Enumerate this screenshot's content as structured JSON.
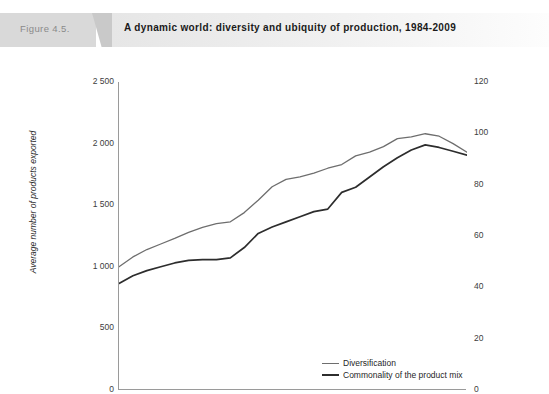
{
  "figure": {
    "number": "Figure 4.5.",
    "title": "A dynamic world: diversity and ubiquity of production, 1984-2009"
  },
  "chart_data": {
    "type": "line",
    "title": "A dynamic world: diversity and ubiquity of production, 1984-2009",
    "xlabel": "",
    "ylabel": "Average number of products exported",
    "y2label": "Average number of countries exporting a similar product mix",
    "xlim": [
      1984,
      2009
    ],
    "ylim": [
      0,
      2500
    ],
    "y2lim": [
      0,
      120
    ],
    "grid": false,
    "legend_position": "inside-bottom-right",
    "x": [
      1984,
      1985,
      1986,
      1987,
      1988,
      1989,
      1990,
      1991,
      1992,
      1993,
      1994,
      1995,
      1996,
      1997,
      1998,
      1999,
      2000,
      2001,
      2002,
      2003,
      2004,
      2005,
      2006,
      2007,
      2008,
      2009
    ],
    "xticks": [
      "1984",
      "1989",
      "1994",
      "1999",
      "2004",
      "2009"
    ],
    "yticks": [
      "0",
      "500",
      "1 000",
      "1 500",
      "2 000",
      "2 500"
    ],
    "y2ticks": [
      "0",
      "20",
      "40",
      "60",
      "80",
      "100",
      "120"
    ],
    "series": [
      {
        "name": "Diversification",
        "axis": "left",
        "color": "#6e6e6e",
        "values": [
          1000,
          1080,
          1140,
          1185,
          1230,
          1280,
          1320,
          1350,
          1365,
          1440,
          1540,
          1650,
          1710,
          1730,
          1760,
          1800,
          1830,
          1900,
          1930,
          1975,
          2040,
          2055,
          2080,
          2060,
          2000,
          1930
        ]
      },
      {
        "name": "Commonality of the product mix",
        "axis": "right",
        "color": "#2d2d2d",
        "values": [
          41.5,
          44.5,
          46.5,
          48.0,
          49.5,
          50.5,
          50.8,
          50.8,
          51.5,
          55.5,
          61.0,
          63.5,
          65.5,
          67.5,
          69.5,
          70.5,
          77.0,
          79.0,
          83.0,
          87.0,
          90.5,
          93.5,
          95.5,
          94.5,
          93.0,
          91.5
        ]
      }
    ]
  },
  "axes": {
    "left_ticks": [
      "2 500",
      "2 000",
      "1 500",
      "1 000",
      "500",
      "0"
    ],
    "right_ticks": [
      "120",
      "100",
      "80",
      "60",
      "40",
      "20",
      "0"
    ],
    "x_ticks": [
      "1984",
      "1989",
      "1994",
      "1999",
      "2004",
      "2009"
    ],
    "left_title": "Average number of products exported",
    "right_title": "Average number of countries exporting a similar product mix"
  },
  "legend": {
    "items": [
      {
        "label": "Diversification",
        "color": "#6e6e6e"
      },
      {
        "label": "Commonality of the product mix",
        "color": "#2d2d2d"
      }
    ]
  }
}
